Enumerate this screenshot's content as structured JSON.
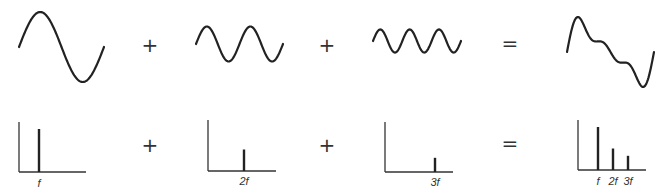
{
  "waves": [
    {
      "name": "fundamental",
      "harmonic": 1,
      "relative_amplitude": 1.0
    },
    {
      "name": "second-harmonic",
      "harmonic": 2,
      "relative_amplitude": 0.5
    },
    {
      "name": "third-harmonic",
      "harmonic": 3,
      "relative_amplitude": 0.33
    },
    {
      "name": "sum",
      "components": [
        1,
        2,
        3
      ]
    }
  ],
  "spectra": [
    {
      "name": "spectrum-fundamental",
      "bars": [
        {
          "label": "f",
          "harmonic": 1,
          "amplitude": 1.0
        }
      ]
    },
    {
      "name": "spectrum-second-harmonic",
      "bars": [
        {
          "label": "2f",
          "harmonic": 2,
          "amplitude": 0.5
        }
      ]
    },
    {
      "name": "spectrum-third-harmonic",
      "bars": [
        {
          "label": "3f",
          "harmonic": 3,
          "amplitude": 0.33
        }
      ]
    },
    {
      "name": "spectrum-sum",
      "bars": [
        {
          "label": "f",
          "harmonic": 1,
          "amplitude": 1.0
        },
        {
          "label": "2f",
          "harmonic": 2,
          "amplitude": 0.5
        },
        {
          "label": "3f",
          "harmonic": 3,
          "amplitude": 0.33
        }
      ]
    }
  ],
  "operators": {
    "plus": "+",
    "equals": "="
  },
  "labels": {
    "f": "f",
    "two_f": "2f",
    "three_f": "3f"
  },
  "colors": {
    "stroke": "#222222",
    "background": "#ffffff"
  }
}
